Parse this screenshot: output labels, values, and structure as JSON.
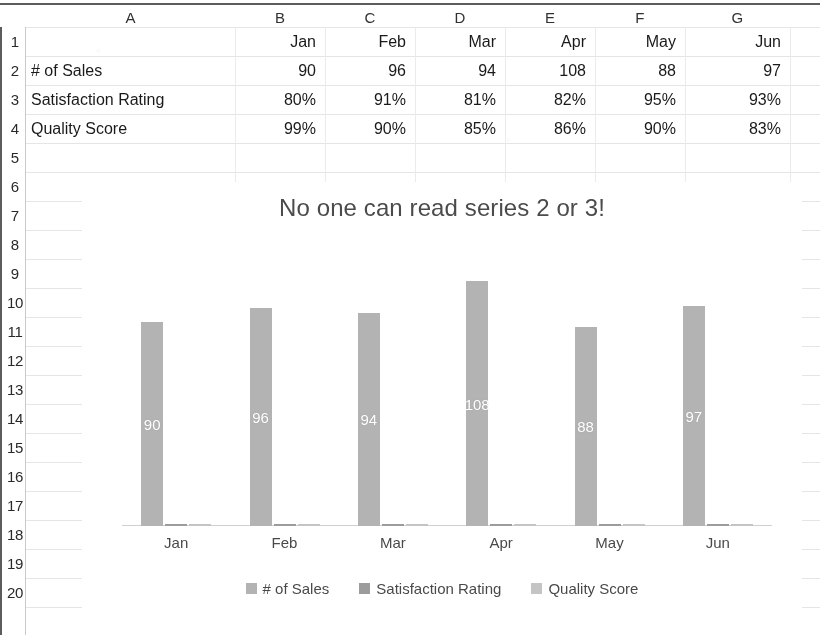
{
  "sheet": {
    "column_headers": [
      "A",
      "B",
      "C",
      "D",
      "E",
      "F",
      "G"
    ],
    "row_headers": [
      "1",
      "2",
      "3",
      "4",
      "5",
      "6",
      "7",
      "8",
      "9",
      "10",
      "11",
      "12",
      "13",
      "14",
      "15",
      "16",
      "17",
      "18",
      "19",
      "20"
    ],
    "rows": [
      {
        "row": "1",
        "a": "",
        "values": [
          "Jan",
          "Feb",
          "Mar",
          "Apr",
          "May",
          "Jun"
        ]
      },
      {
        "row": "2",
        "a": "# of Sales",
        "values": [
          "90",
          "96",
          "94",
          "108",
          "88",
          "97"
        ]
      },
      {
        "row": "3",
        "a": "Satisfaction Rating",
        "values": [
          "80%",
          "91%",
          "81%",
          "82%",
          "95%",
          "93%"
        ]
      },
      {
        "row": "4",
        "a": "Quality Score",
        "values": [
          "99%",
          "90%",
          "85%",
          "86%",
          "90%",
          "83%"
        ]
      }
    ]
  },
  "chart_data": {
    "type": "bar",
    "title": "No one can read series 2 or 3!",
    "xlabel": "",
    "ylabel": "",
    "grid": false,
    "legend_position": "bottom",
    "ylim": [
      0,
      120
    ],
    "categories": [
      "Jan",
      "Feb",
      "Mar",
      "Apr",
      "May",
      "Jun"
    ],
    "series": [
      {
        "name": "# of Sales",
        "color": "#b2b2b2",
        "values": [
          90,
          96,
          94,
          108,
          88,
          97
        ],
        "labels": [
          "90",
          "96",
          "94",
          "108",
          "88",
          "97"
        ]
      },
      {
        "name": "Satisfaction Rating",
        "color": "#9b9b9b",
        "values": [
          0.8,
          0.91,
          0.81,
          0.82,
          0.95,
          0.93
        ],
        "labels": [
          "80%",
          "91%",
          "81%",
          "82%",
          "95%",
          "93%"
        ]
      },
      {
        "name": "Quality Score",
        "color": "#c3c3c3",
        "values": [
          0.99,
          0.9,
          0.85,
          0.86,
          0.9,
          0.83
        ],
        "labels": [
          "99%",
          "90%",
          "85%",
          "86%",
          "90%",
          "83%"
        ]
      }
    ]
  }
}
